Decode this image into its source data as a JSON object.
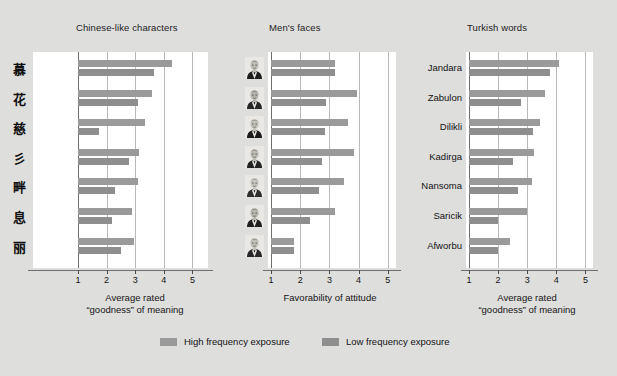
{
  "figure": {
    "background_color": "#dededd",
    "plot_background": "#ffffff"
  },
  "legend": {
    "items": [
      {
        "label": "High frequency exposure",
        "color": "#9a9a9a",
        "key": "high"
      },
      {
        "label": "Low frequency exposure",
        "color": "#8e8e8e",
        "key": "low"
      }
    ]
  },
  "chart_data": {
    "type": "bar",
    "orientation": "horizontal",
    "title": "",
    "grid": true,
    "legend_position": "bottom",
    "series_names": [
      "High frequency exposure",
      "Low frequency exposure"
    ],
    "panels": [
      {
        "title": "Chinese-like characters",
        "xlabel_line1": "Average rated",
        "xlabel_line2": "“goodness” of meaning",
        "xlim": [
          1,
          5
        ],
        "xticks": [
          1,
          2,
          3,
          4,
          5
        ],
        "xticklabels": [
          "1",
          "2",
          "3",
          "4",
          "5"
        ],
        "category_type": "glyph",
        "categories": [
          "慕",
          "花",
          "慈",
          "彡",
          "畔",
          "息",
          "丽"
        ],
        "series": [
          {
            "name": "High frequency exposure",
            "values": [
              4.3,
              3.6,
              3.35,
              3.15,
              3.1,
              2.9,
              2.95
            ]
          },
          {
            "name": "Low frequency exposure",
            "values": [
              3.65,
              3.1,
              1.75,
              2.8,
              2.3,
              2.2,
              2.5
            ]
          }
        ]
      },
      {
        "title": "Men's faces",
        "xlabel_line1": "Favorability of attitude",
        "xlabel_line2": "",
        "xlim": [
          1,
          5
        ],
        "xticks": [
          1,
          2,
          3,
          4,
          5
        ],
        "xticklabels": [
          "1",
          "2",
          "3",
          "4",
          "5"
        ],
        "category_type": "face",
        "categories": [
          "face-1",
          "face-2",
          "face-3",
          "face-4",
          "face-5",
          "face-6",
          "face-7"
        ],
        "series": [
          {
            "name": "High frequency exposure",
            "values": [
              3.2,
              3.95,
              3.65,
              3.85,
              3.5,
              3.2,
              1.8
            ]
          },
          {
            "name": "Low frequency exposure",
            "values": [
              3.2,
              2.9,
              2.85,
              2.75,
              2.65,
              2.35,
              1.8
            ]
          }
        ]
      },
      {
        "title": "Turkish words",
        "xlabel_line1": "Average rated",
        "xlabel_line2": "“goodness” of meaning",
        "xlim": [
          1,
          5
        ],
        "xticks": [
          1,
          2,
          3,
          4,
          5
        ],
        "xticklabels": [
          "1",
          "2",
          "3",
          "4",
          "5"
        ],
        "category_type": "text",
        "categories": [
          "Jandara",
          "Zabulon",
          "Dilikli",
          "Kadirga",
          "Nansoma",
          "Saricik",
          "Afworbu"
        ],
        "series": [
          {
            "name": "High frequency exposure",
            "values": [
              4.1,
              3.6,
              3.45,
              3.25,
              3.15,
              3.0,
              2.4
            ]
          },
          {
            "name": "Low frequency exposure",
            "values": [
              3.8,
              2.8,
              3.2,
              2.5,
              2.7,
              2.0,
              2.0
            ]
          }
        ]
      }
    ]
  }
}
